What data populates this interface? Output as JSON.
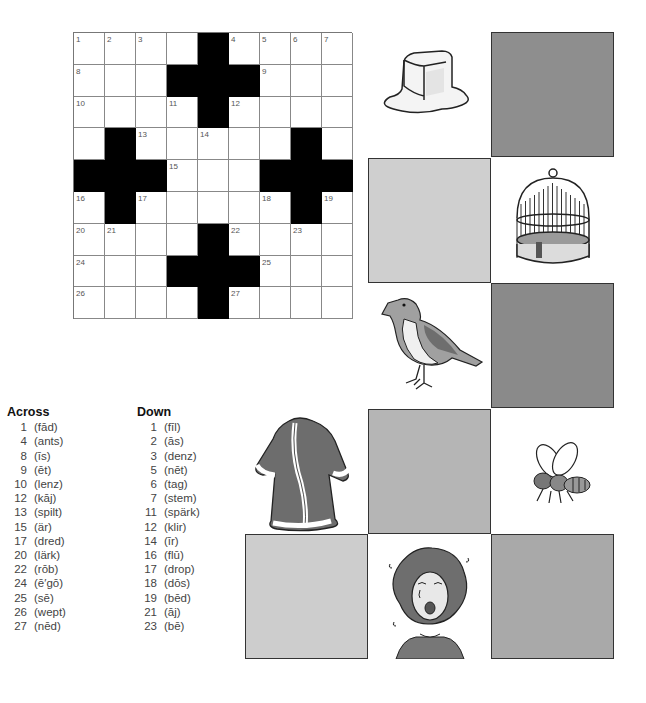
{
  "crossword": {
    "rows": 9,
    "cols": 9,
    "layout": [
      [
        "1",
        "2",
        "3",
        "",
        "#",
        "4",
        "5",
        "6",
        "7"
      ],
      [
        "8",
        "",
        "",
        "#",
        "#",
        "#",
        "9",
        "",
        ""
      ],
      [
        "10",
        "",
        "",
        "11",
        "#",
        "12",
        "",
        "",
        ""
      ],
      [
        "",
        "#",
        "13",
        "",
        "14",
        "",
        "",
        "#",
        ""
      ],
      [
        "#",
        "#",
        "#",
        "15",
        "",
        "",
        "#",
        "#",
        "#"
      ],
      [
        "16",
        "#",
        "17",
        "",
        "",
        "",
        "18",
        "#",
        "19"
      ],
      [
        "20",
        "21",
        "",
        "",
        "#",
        "22",
        "",
        "23",
        ""
      ],
      [
        "24",
        "",
        "",
        "#",
        "#",
        "#",
        "25",
        "",
        ""
      ],
      [
        "26",
        "",
        "",
        "",
        "#",
        "27",
        "",
        "",
        ""
      ]
    ]
  },
  "clues": {
    "across_title": "Across",
    "down_title": "Down",
    "across": [
      {
        "num": "1",
        "text": "(fād)"
      },
      {
        "num": "4",
        "text": "(ants)"
      },
      {
        "num": "8",
        "text": "(īs)"
      },
      {
        "num": "9",
        "text": "(ēt)"
      },
      {
        "num": "10",
        "text": "(lenz)"
      },
      {
        "num": "12",
        "text": "(kāj)"
      },
      {
        "num": "13",
        "text": "(spilt)"
      },
      {
        "num": "15",
        "text": "(är)"
      },
      {
        "num": "17",
        "text": "(dred)"
      },
      {
        "num": "20",
        "text": "(lärk)"
      },
      {
        "num": "22",
        "text": "(rōb)"
      },
      {
        "num": "24",
        "text": "(ē′gō)"
      },
      {
        "num": "25",
        "text": "(sē)"
      },
      {
        "num": "26",
        "text": "(wept)"
      },
      {
        "num": "27",
        "text": "(nēd)"
      }
    ],
    "down": [
      {
        "num": "1",
        "text": "(fīl)"
      },
      {
        "num": "2",
        "text": "(ās)"
      },
      {
        "num": "3",
        "text": "(denz)"
      },
      {
        "num": "5",
        "text": "(nēt)"
      },
      {
        "num": "6",
        "text": "(tag)"
      },
      {
        "num": "7",
        "text": "(stem)"
      },
      {
        "num": "11",
        "text": "(spärk)"
      },
      {
        "num": "12",
        "text": "(klir)"
      },
      {
        "num": "14",
        "text": "(īr)"
      },
      {
        "num": "16",
        "text": "(flū)"
      },
      {
        "num": "17",
        "text": "(drop)"
      },
      {
        "num": "18",
        "text": "(dōs)"
      },
      {
        "num": "19",
        "text": "(bēd)"
      },
      {
        "num": "21",
        "text": "(āj)"
      },
      {
        "num": "23",
        "text": "(bē)"
      }
    ]
  },
  "picture_board": {
    "squares": [
      {
        "row": 0,
        "col": 1,
        "type": "image",
        "icon": "melting-ice-cube-icon"
      },
      {
        "row": 0,
        "col": 2,
        "type": "shade",
        "color": "#8e8e8e"
      },
      {
        "row": 1,
        "col": 1,
        "type": "shade",
        "color": "#cfcfcf"
      },
      {
        "row": 1,
        "col": 2,
        "type": "image",
        "icon": "birdcage-icon"
      },
      {
        "row": 2,
        "col": 1,
        "type": "image",
        "icon": "bird-lark-icon"
      },
      {
        "row": 2,
        "col": 2,
        "type": "shade",
        "color": "#8a8a8a"
      },
      {
        "row": 3,
        "col": 0,
        "type": "image",
        "icon": "robe-icon"
      },
      {
        "row": 3,
        "col": 1,
        "type": "shade",
        "color": "#b5b5b5"
      },
      {
        "row": 3,
        "col": 2,
        "type": "image",
        "icon": "bee-icon"
      },
      {
        "row": 4,
        "col": 0,
        "type": "shade",
        "color": "#cdcdcd"
      },
      {
        "row": 4,
        "col": 1,
        "type": "image",
        "icon": "crying-girl-icon"
      },
      {
        "row": 4,
        "col": 2,
        "type": "shade",
        "color": "#a9a9a9"
      }
    ]
  }
}
